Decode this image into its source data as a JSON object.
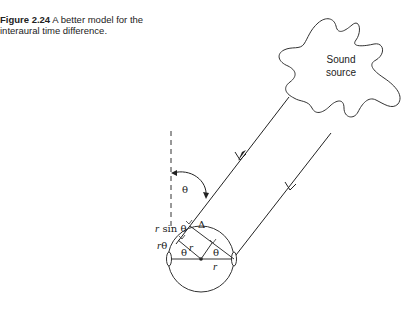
{
  "figure": {
    "number_label": "Figure 2.24",
    "caption_text": "A better model for the interaural time difference."
  },
  "diagram": {
    "source_label_line1": "Sound",
    "source_label_line2": "source",
    "theta": "θ",
    "r": "r",
    "r_sin_theta_r": "r",
    "r_sin_theta_rest": " sin θ",
    "r_theta_r": "r",
    "r_theta_rest": "θ",
    "delta": "Δ"
  }
}
